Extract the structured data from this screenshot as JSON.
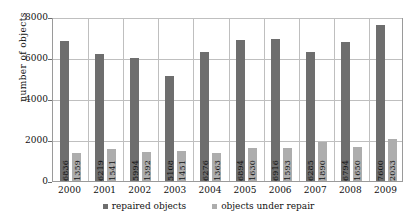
{
  "chart_data": {
    "type": "bar",
    "title": "",
    "xlabel": "",
    "ylabel": "number of objects",
    "ylim": [
      0,
      8000
    ],
    "ytick_values": [
      0,
      2000,
      4000,
      6000,
      8000
    ],
    "ytick_labels": [
      "0",
      "2000",
      "4000",
      "6000",
      "8000"
    ],
    "grid": true,
    "legend_position": "bottom",
    "categories": [
      "2000",
      "2001",
      "2002",
      "2003",
      "2004",
      "2005",
      "2006",
      "2007",
      "2008",
      "2009"
    ],
    "series": [
      {
        "name": "repaired objects",
        "color": "#6e6e6e",
        "values": [
          6836,
          6219,
          5994,
          5108,
          6276,
          6894,
          6916,
          6285,
          6794,
          7600
        ]
      },
      {
        "name": "objects under repair",
        "color": "#adadad",
        "values": [
          1359,
          1541,
          1392,
          1451,
          1363,
          1630,
          1593,
          1890,
          1650,
          2033
        ]
      }
    ]
  }
}
